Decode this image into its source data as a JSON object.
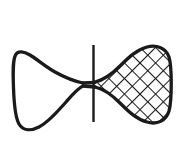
{
  "figure": {
    "label": "C.",
    "caption_position": "top-center",
    "background_color": "#ffffff",
    "ink_color": "#1a1a1a",
    "parts": [
      {
        "name": "left-lobe",
        "fill": "none",
        "outline_color": "#1a1a1a",
        "shape": "rounded bulb"
      },
      {
        "name": "right-lobe",
        "fill": "cross-hatch",
        "outline_color": "#1a1a1a",
        "shape": "rounded triangular bulb"
      },
      {
        "name": "waist",
        "fill": "none",
        "outline_color": "#1a1a1a",
        "shape": "narrow neck"
      },
      {
        "name": "axis-line",
        "fill": "none",
        "outline_color": "#1a1a1a",
        "shape": "vertical stroke"
      }
    ],
    "hatching": {
      "style": "diagonal cross-hatch",
      "angle_degrees": 45,
      "spacing_px": 11,
      "stroke_width_px": 2.1,
      "color": "#1a1a1a"
    },
    "geometry": {
      "outline_stroke_width_px": 3.2,
      "axis_line_x": 93,
      "axis_line_top_y": 45,
      "axis_line_bottom_y": 122,
      "left_edge_x": 13,
      "right_edge_x": 171,
      "top_edge_y": 47,
      "bottom_edge_y": 129
    }
  }
}
